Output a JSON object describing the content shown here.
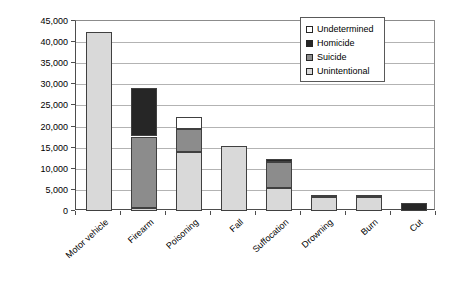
{
  "chart_data": {
    "type": "bar",
    "stacked": true,
    "title": "",
    "xlabel": "",
    "ylabel": "Deaths",
    "ylim": [
      0,
      45000
    ],
    "ytick_step": 5000,
    "ytick_labels": [
      "0",
      "5,000",
      "10,000",
      "15,000",
      "20,000",
      "25,000",
      "30,000",
      "35,000",
      "40,000",
      "45,000"
    ],
    "grid": true,
    "legend_position": "top-right-inside",
    "legend_order": [
      "Undetermined",
      "Homicide",
      "Suicide",
      "Unintentional"
    ],
    "categories": [
      "Motor vehicle",
      "Firearm",
      "Poisoning",
      "Fall",
      "Suffocation",
      "Drowning",
      "Burn",
      "Cut"
    ],
    "series": [
      {
        "name": "Unintentional",
        "color": "#d9d9d9",
        "values": [
          42300,
          800,
          14000,
          15400,
          5500,
          3300,
          3200,
          0
        ]
      },
      {
        "name": "Suicide",
        "color": "#8c8c8c",
        "values": [
          0,
          16900,
          5500,
          0,
          6200,
          0,
          0,
          0
        ]
      },
      {
        "name": "Homicide",
        "color": "#262626",
        "values": [
          0,
          11300,
          0,
          0,
          700,
          400,
          300,
          2000
        ]
      },
      {
        "name": "Undetermined",
        "color": "#ffffff",
        "values": [
          0,
          0,
          2800,
          0,
          0,
          0,
          0,
          0
        ]
      }
    ],
    "totals": [
      42300,
      29000,
      22300,
      15400,
      12400,
      3700,
      3500,
      2000
    ]
  },
  "colors": {
    "background": "#ffffff",
    "gridline": "#b3b3b3",
    "axis": "#4d4d4d",
    "plot_border": "#8c8c8c",
    "bar_border": "#404040",
    "text": "#000000"
  }
}
